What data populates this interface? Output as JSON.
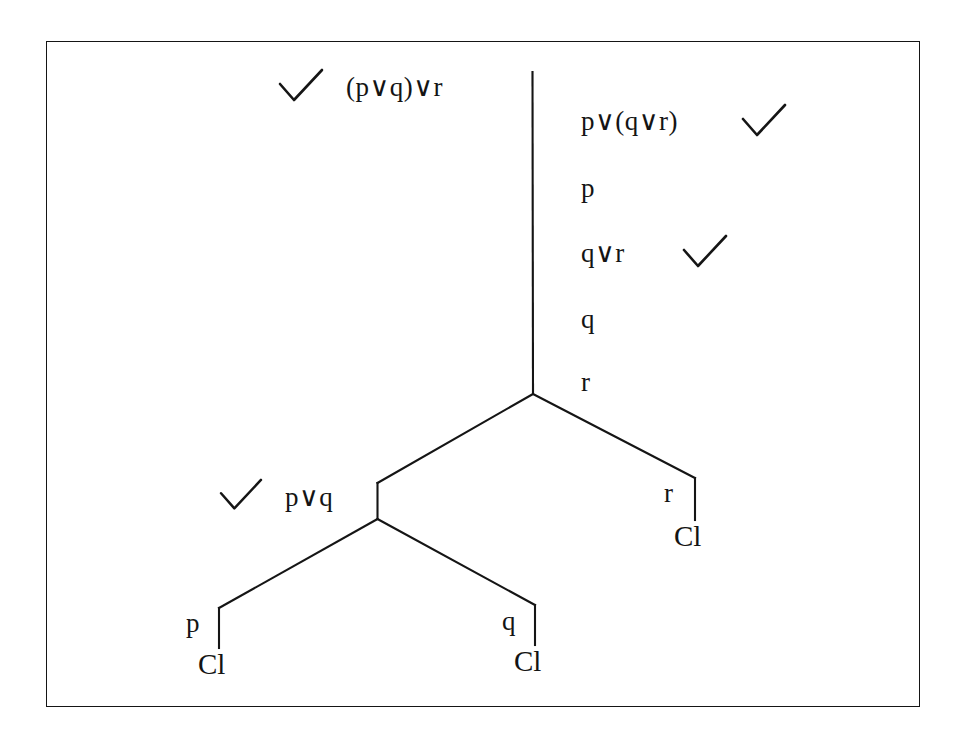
{
  "diagram": {
    "frame_color": "#151515",
    "line_color": "#151515",
    "text_color": "#141414",
    "background": "#ffffff"
  },
  "left_column": {
    "check_mark": "✓",
    "formula": "(p∨q)∨r"
  },
  "right_column": {
    "rows": [
      {
        "formula": "p∨(q∨r)",
        "check_mark": "✓",
        "checked": true
      },
      {
        "formula": "p",
        "check_mark": "",
        "checked": false
      },
      {
        "formula": "q∨r",
        "check_mark": "✓",
        "checked": true
      },
      {
        "formula": "q",
        "check_mark": "",
        "checked": false
      },
      {
        "formula": "r",
        "check_mark": "",
        "checked": false
      }
    ]
  },
  "branch_nodes": {
    "left_disjunction": {
      "check_mark": "✓",
      "formula": "p∨q"
    },
    "right_branch_label": "r",
    "right_branch_closure": "Cl"
  },
  "leaves": [
    {
      "label": "p",
      "closure": "Cl"
    },
    {
      "label": "q",
      "closure": "Cl"
    }
  ]
}
